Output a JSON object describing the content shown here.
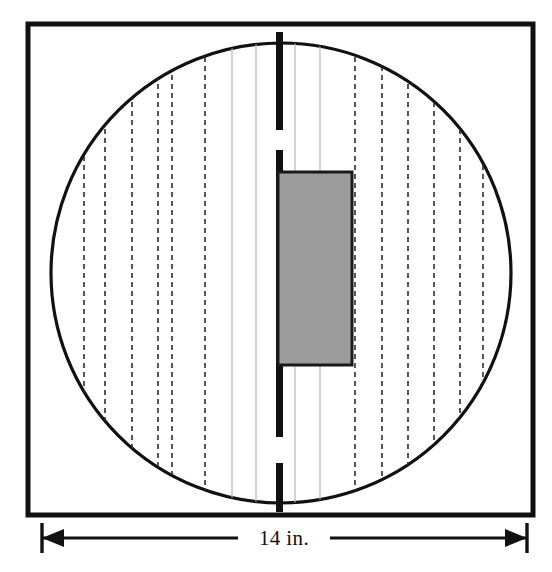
{
  "figure": {
    "units": "inches"
  },
  "frame": {
    "name": "outer-square-frame",
    "x": 28,
    "y": 24,
    "width": 505,
    "height": 491,
    "stroke_color": "#111111",
    "stroke_width": 5,
    "fill_color": "#ffffff"
  },
  "circle": {
    "name": "large-circle",
    "center_x": 281,
    "center_y": 273,
    "radius": 230,
    "stroke_color": "#111111",
    "stroke_width": 3.2,
    "fill_color": "#ffffff"
  },
  "center_bar": {
    "name": "thick-center-bar",
    "x": 276,
    "width": 7,
    "color": "#111111",
    "segments": [
      {
        "y_start": 32,
        "y_end": 130
      },
      {
        "y_start": 150,
        "y_end": 437
      },
      {
        "y_start": 463,
        "y_end": 512
      }
    ]
  },
  "shaded_block": {
    "name": "shaded-rectangle",
    "x": 278,
    "y": 172,
    "width": 74,
    "height": 193,
    "fill_color": "#9c9c9c",
    "stroke_color": "#1a1a1a",
    "stroke_width": 3
  },
  "dashed_lines": {
    "name": "dashed-guide-lines",
    "color": "#2b2b2b",
    "stroke_width": 1.6,
    "dash_pattern": "5,4",
    "x_positions": [
      84,
      105,
      132,
      158,
      172,
      205,
      355,
      382,
      408,
      434,
      460,
      483
    ]
  },
  "solid_light_lines": {
    "name": "light-guide-lines",
    "color": "#b8b8b8",
    "stroke_width": 1.2,
    "x_positions": [
      232,
      256,
      295,
      320
    ]
  },
  "dimension": {
    "name": "width-dimension",
    "label": "14 in.",
    "y": 538,
    "x_start": 42,
    "x_end": 527,
    "color": "#111111",
    "line_width": 3,
    "tick_height": 30,
    "arrow_length": 22,
    "arrow_half_width": 9,
    "label_x": 284,
    "label_gap": 46
  },
  "colors": {
    "ink": "#111111",
    "shade_gray": "#9c9c9c",
    "light_gray": "#b8b8b8",
    "paper": "#ffffff"
  }
}
